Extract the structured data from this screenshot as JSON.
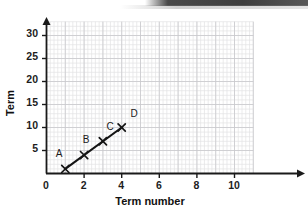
{
  "chart_data": {
    "type": "scatter",
    "title": "",
    "xlabel": "Term number",
    "ylabel": "Term",
    "xlim": [
      0,
      11
    ],
    "ylim": [
      0,
      33
    ],
    "grid": true,
    "grid_minor_step_x": 0.2,
    "grid_minor_step_y": 1,
    "grid_major_step_x": 1,
    "grid_major_step_y": 5,
    "legend": "none",
    "x_ticks": [
      0,
      2,
      4,
      6,
      8,
      10
    ],
    "x_tick_labels": [
      "0",
      "2",
      "4",
      "6",
      "8",
      "10"
    ],
    "y_ticks": [
      5,
      10,
      15,
      20,
      25,
      30
    ],
    "y_tick_labels": [
      "5",
      "10",
      "15",
      "20",
      "25",
      "30"
    ],
    "marker": "x-cross",
    "series": [
      {
        "name": "Term sequence",
        "x": [
          1,
          2,
          3,
          4
        ],
        "y": [
          1,
          4,
          7,
          10
        ],
        "point_labels": [
          "A",
          "B",
          "C",
          "D"
        ],
        "line": true,
        "color": "#141414"
      }
    ],
    "annotations": [
      {
        "text": "A",
        "x": 1,
        "y": 1
      },
      {
        "text": "B",
        "x": 2,
        "y": 4
      },
      {
        "text": "C",
        "x": 3,
        "y": 7
      },
      {
        "text": "D",
        "x": 4,
        "y": 10
      }
    ]
  },
  "axes": {
    "x_label": "Term number",
    "y_label": "Term",
    "x_tick_0": "0",
    "x_tick_1": "2",
    "x_tick_2": "4",
    "x_tick_3": "6",
    "x_tick_4": "8",
    "x_tick_5": "10",
    "y_tick_0": "5",
    "y_tick_1": "10",
    "y_tick_2": "15",
    "y_tick_3": "20",
    "y_tick_4": "25",
    "y_tick_5": "30"
  },
  "points": {
    "a": "A",
    "b": "B",
    "c": "C",
    "d": "D"
  },
  "colors": {
    "grid_minor": "#e2e2e4",
    "grid_major": "#c9c9cd",
    "axis": "#1a1a1a",
    "data": "#141414",
    "page_background": "#ffffff",
    "scan_band": "#2e2e2e"
  }
}
